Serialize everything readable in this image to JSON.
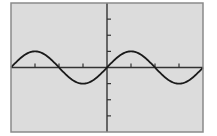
{
  "chart_data": {
    "type": "line",
    "title": "",
    "xlabel": "",
    "ylabel": "",
    "xlim": [
      -4,
      4
    ],
    "ylim": [
      -4,
      4
    ],
    "x_tick_step": 1,
    "y_tick_step": 1,
    "grid": false,
    "legend": null,
    "series": [
      {
        "name": "y = sin(πx/2)",
        "function": "sin(pi*x/2)",
        "x": [
          -4,
          -3,
          -2,
          -1,
          0,
          1,
          2,
          3,
          4
        ],
        "values": [
          0,
          1,
          0,
          -1,
          0,
          1,
          0,
          -1,
          0
        ]
      }
    ]
  },
  "colors": {
    "page_background": "#ffffff",
    "plot_background": "#dcdcdc",
    "frame": "#8a8a8a",
    "axis": "#333333",
    "curve": "#1a1a1a"
  }
}
